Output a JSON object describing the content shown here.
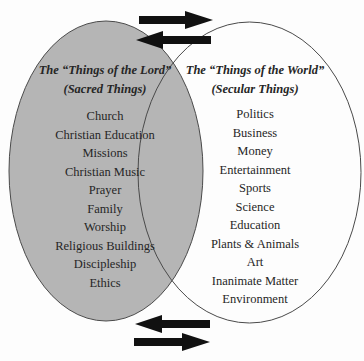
{
  "diagram": {
    "type": "venn",
    "colors": {
      "sacred_fill": "#b5b5b5",
      "secular_fill": "#ffffff",
      "outline": "#4a4a4a",
      "arrow": "#111111",
      "text": "#262626"
    },
    "sacred": {
      "title": "The “Things of the Lord”",
      "subtitle": "(Sacred Things)",
      "items": [
        "Church",
        "Christian Education",
        "Missions",
        "Christian Music",
        "Prayer",
        "Family",
        "Worship",
        "Religious Buildings",
        "Discipleship",
        "Ethics"
      ]
    },
    "secular": {
      "title": "The “Things of the World”",
      "subtitle": "(Secular Things)",
      "items": [
        "Politics",
        "Business",
        "Money",
        "Entertainment",
        "Sports",
        "Science",
        "Education",
        "Plants & Animals",
        "Art",
        "Inanimate Matter",
        "Environment"
      ]
    },
    "arrows": [
      {
        "position": "top",
        "direction": "right"
      },
      {
        "position": "top",
        "direction": "left"
      },
      {
        "position": "bottom",
        "direction": "left"
      },
      {
        "position": "bottom",
        "direction": "right"
      }
    ]
  }
}
